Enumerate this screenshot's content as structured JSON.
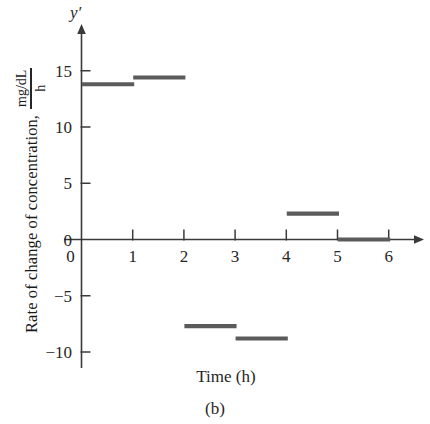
{
  "figure": {
    "caption": "(b)",
    "axis_symbol": "y′",
    "xaxis_title": "Time (h)",
    "yaxis_title": "Rate of change of concentration,",
    "yaxis_unit_numerator": "mg/dL",
    "yaxis_unit_denominator": "h",
    "ink_color": "#5b5b5b",
    "axis_color": "#3a3a3a",
    "text_color": "#262626"
  },
  "chart_data": {
    "type": "bar",
    "title": "",
    "subtitle": "",
    "xlabel": "Time (h)",
    "ylabel": "Rate of change of concentration, mg/dL / h",
    "ylabel_unit": "mg/dL per h",
    "style": "step-function (piecewise constant rate over each 1-hour interval)",
    "grid": false,
    "legend": null,
    "xlim": [
      0,
      6.4
    ],
    "ylim": [
      -11.5,
      17.5
    ],
    "xticks": [
      0,
      1,
      2,
      3,
      4,
      5,
      6
    ],
    "xtick_labels": [
      "0",
      "1",
      "2",
      "3",
      "4",
      "5",
      "6"
    ],
    "yticks": [
      -10,
      -5,
      0,
      5,
      10,
      15
    ],
    "ytick_labels": [
      "−10",
      "−5",
      "0",
      "5",
      "10",
      "15"
    ],
    "categories": [
      "0–1",
      "1–2",
      "2–3",
      "3–4",
      "4–5",
      "5–6"
    ],
    "intervals": [
      {
        "x_start": 0,
        "x_end": 1,
        "value": 13.8
      },
      {
        "x_start": 1,
        "x_end": 2,
        "value": 14.4
      },
      {
        "x_start": 2,
        "x_end": 3,
        "value": -7.7
      },
      {
        "x_start": 3,
        "x_end": 4,
        "value": -8.8
      },
      {
        "x_start": 4,
        "x_end": 5,
        "value": 2.3
      },
      {
        "x_start": 5,
        "x_end": 6,
        "value": 0.0
      }
    ],
    "values": [
      13.8,
      14.4,
      -7.7,
      -8.8,
      2.3,
      0.0
    ]
  }
}
